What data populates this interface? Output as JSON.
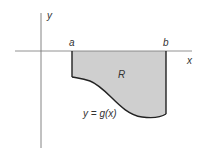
{
  "diagram": {
    "type": "region-below-axis",
    "labels": {
      "y_axis": "y",
      "x_axis": "x",
      "a": "a",
      "b": "b",
      "region": "R",
      "curve": "y = g(x)"
    },
    "colors": {
      "region_fill": "#cfcfcf",
      "axis": "#666666",
      "boundary": "#222222",
      "background": "#ffffff"
    }
  }
}
